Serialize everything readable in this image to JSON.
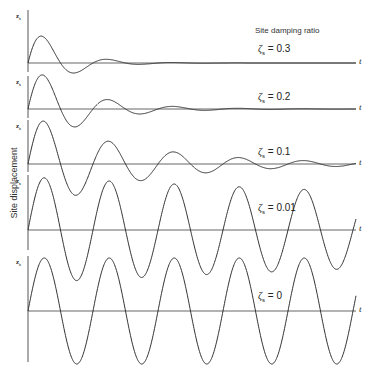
{
  "chart_data": {
    "type": "line",
    "title": "Site damping ratio",
    "ylabel": "Site displacement",
    "xlabel": "t",
    "axis_symbol": "z",
    "axis_symbol_sub": "s",
    "period_px": 65,
    "panels": [
      {
        "label_symbol": "ζ",
        "label_sub": "s",
        "label_value": "= 0.3",
        "zeta": 0.3,
        "baseline_y": 63,
        "amplitude": 42,
        "axis_top": 10,
        "axis_bottom": 72,
        "label_x": 258,
        "label_y": 43
      },
      {
        "label_symbol": "ζ",
        "label_sub": "s",
        "label_value": "= 0.2",
        "zeta": 0.2,
        "baseline_y": 109,
        "amplitude": 46,
        "axis_top": 76,
        "axis_bottom": 118,
        "label_x": 258,
        "label_y": 91
      },
      {
        "label_symbol": "ζ",
        "label_sub": "s",
        "label_value": "= 0.1",
        "zeta": 0.1,
        "baseline_y": 164,
        "amplitude": 50,
        "axis_top": 120,
        "axis_bottom": 172,
        "label_x": 258,
        "label_y": 146
      },
      {
        "label_symbol": "ζ",
        "label_sub": "s",
        "label_value": "= 0.01",
        "zeta": 0.01,
        "baseline_y": 230,
        "amplitude": 53,
        "axis_top": 175,
        "axis_bottom": 250,
        "label_x": 258,
        "label_y": 202
      },
      {
        "label_symbol": "ζ",
        "label_sub": "s",
        "label_value": "= 0",
        "zeta": 0,
        "baseline_y": 311,
        "amplitude": 53,
        "axis_top": 256,
        "axis_bottom": 362,
        "label_x": 258,
        "label_y": 290
      }
    ],
    "x_range_px": [
      28,
      356
    ],
    "legend_position": "upper right"
  }
}
